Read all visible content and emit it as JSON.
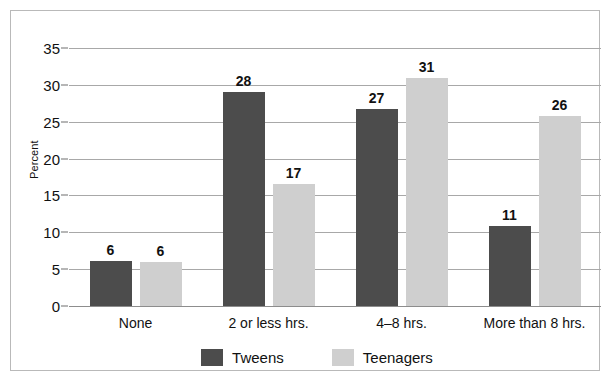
{
  "chart_data": {
    "type": "bar",
    "title": "",
    "xlabel": "",
    "ylabel": "Percent",
    "ylim": [
      0,
      35
    ],
    "ytick_step": 5,
    "yticks": [
      "0",
      "5",
      "10",
      "15",
      "20",
      "25",
      "30",
      "35"
    ],
    "grid": true,
    "legend_position": "bottom-center",
    "categories": [
      "None",
      "2 or less hrs.",
      "4–8 hrs.",
      "More than 8 hrs."
    ],
    "series": [
      {
        "name": "Tweens",
        "color": "#4c4c4c",
        "values": [
          6,
          28,
          27,
          11
        ],
        "labels": [
          "6",
          "28",
          "27",
          "11"
        ],
        "plotted_heights": [
          6.1,
          29.0,
          26.7,
          10.8
        ]
      },
      {
        "name": "Teenagers",
        "color": "#cfcfcf",
        "values": [
          6,
          17,
          31,
          26
        ],
        "labels": [
          "6",
          "17",
          "31",
          "26"
        ],
        "plotted_heights": [
          6.0,
          16.5,
          31.0,
          25.8
        ]
      }
    ]
  },
  "colors": {
    "tweens": "#4c4c4c",
    "teenagers": "#cfcfcf",
    "gridline": "#a8a8a8",
    "border": "#b9b9b9",
    "text": "#111111",
    "background": "#ffffff"
  }
}
